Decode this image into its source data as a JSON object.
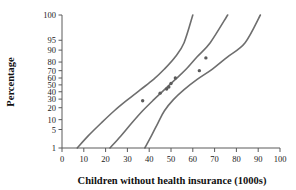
{
  "chart_data": {
    "type": "scatter",
    "title": "",
    "xlabel": "Children without health insurance (1000s)",
    "ylabel": "Percentage",
    "xlim": [
      0,
      100
    ],
    "ylim": [
      1,
      100
    ],
    "grid": false,
    "legend": "none",
    "x_ticks": [
      0,
      10,
      20,
      30,
      40,
      50,
      60,
      70,
      80,
      90,
      100
    ],
    "x_tick_labels": [
      "0",
      "10",
      "20",
      "30",
      "40",
      "50",
      "60",
      "70",
      "80",
      "90",
      "100"
    ],
    "y_ticks": [
      1,
      5,
      10,
      20,
      30,
      40,
      50,
      60,
      70,
      80,
      90,
      95,
      100
    ],
    "y_tick_labels": [
      "1",
      "5",
      "10",
      "20",
      "30",
      "40",
      "50",
      "60",
      "70",
      "80",
      "90",
      "95",
      "100"
    ],
    "y_scale": "normal-probability",
    "points": [
      {
        "x": 37,
        "y": 28
      },
      {
        "x": 45,
        "y": 38
      },
      {
        "x": 48,
        "y": 44
      },
      {
        "x": 49,
        "y": 47
      },
      {
        "x": 50,
        "y": 52
      },
      {
        "x": 52,
        "y": 60
      },
      {
        "x": 63,
        "y": 70
      },
      {
        "x": 66,
        "y": 84
      }
    ],
    "series": [
      {
        "name": "upper-confidence-band",
        "x": [
          7,
          12,
          18,
          24,
          30,
          36,
          42,
          47,
          52,
          56,
          60
        ],
        "y": [
          1,
          3,
          8,
          17,
          29,
          43,
          58,
          72,
          85,
          94,
          100
        ]
      },
      {
        "name": "fitted-line",
        "x": [
          22,
          27,
          32,
          37,
          42,
          47,
          52,
          57,
          62,
          68,
          76
        ],
        "y": [
          1,
          3,
          8,
          17,
          29,
          43,
          58,
          72,
          85,
          94,
          100
        ]
      },
      {
        "name": "lower-confidence-band",
        "x": [
          38,
          41,
          44,
          47,
          51,
          56,
          62,
          69,
          76,
          84,
          91
        ],
        "y": [
          1,
          3,
          8,
          17,
          29,
          43,
          58,
          72,
          85,
          94,
          100
        ]
      }
    ]
  }
}
